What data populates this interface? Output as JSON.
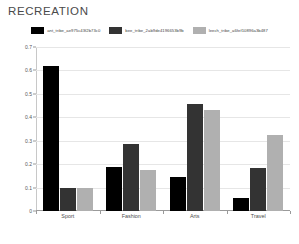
{
  "title": "RECREATION",
  "legend": {
    "position": "top-center",
    "items": [
      {
        "label": "ant_tribe_ae975c43f2b73c0",
        "color": "#000000"
      },
      {
        "label": "bee_tribe_2ab9de4196653b9b",
        "color": "#333333"
      },
      {
        "label": "leech_tribe_a6fef10896a3b487",
        "color": "#b0b0b0"
      }
    ]
  },
  "axes": {
    "y_ticks": [
      "0",
      "0.1",
      "0.2",
      "0.3",
      "0.4",
      "0.5",
      "0.6",
      "0.7"
    ],
    "x_ticks": [
      "Sport",
      "Fashion",
      "Arts",
      "Travel"
    ]
  },
  "chart_data": {
    "type": "bar",
    "title": "RECREATION",
    "xlabel": "",
    "ylabel": "",
    "ylim": [
      0,
      0.7
    ],
    "grid": true,
    "legend_position": "top-center",
    "categories": [
      "Sport",
      "Fashion",
      "Arts",
      "Travel"
    ],
    "series": [
      {
        "name": "ant_tribe_ae975c43f2b73c0",
        "color": "#000000",
        "values": [
          0.62,
          0.19,
          0.145,
          0.055
        ]
      },
      {
        "name": "bee_tribe_2ab9de4196653b9b",
        "color": "#333333",
        "values": [
          0.1,
          0.285,
          0.455,
          0.185
        ]
      },
      {
        "name": "leech_tribe_a6fef10896a3b487",
        "color": "#b0b0b0",
        "values": [
          0.1,
          0.175,
          0.43,
          0.325
        ]
      }
    ]
  }
}
